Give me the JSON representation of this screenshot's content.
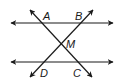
{
  "diagram": {
    "colors": {
      "stroke": "#1a1a1a",
      "background": "#ffffff"
    },
    "points": {
      "A": {
        "label": "A",
        "x": 47,
        "y": 19
      },
      "B": {
        "label": "B",
        "x": 79,
        "y": 19
      },
      "M": {
        "label": "M",
        "x": 68,
        "y": 47
      },
      "D": {
        "label": "D",
        "x": 42,
        "y": 76
      },
      "C": {
        "label": "C",
        "x": 75,
        "y": 76
      }
    },
    "lines": [
      {
        "id": "top-parallel",
        "from": [
          11,
          23
        ],
        "to": [
          113,
          23
        ],
        "arrows": "both"
      },
      {
        "id": "bottom-parallel",
        "from": [
          11,
          62
        ],
        "to": [
          113,
          62
        ],
        "arrows": "both"
      },
      {
        "id": "transversal-AC",
        "from": [
          30,
          10
        ],
        "to": [
          92,
          77
        ],
        "arrows": "both",
        "through": [
          "A",
          "M",
          "C"
        ]
      },
      {
        "id": "transversal-BD",
        "from": [
          93,
          10
        ],
        "to": [
          30,
          77
        ],
        "arrows": "both",
        "through": [
          "B",
          "M",
          "D"
        ]
      }
    ]
  }
}
